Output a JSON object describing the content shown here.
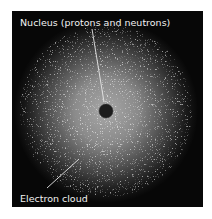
{
  "diagram": {
    "labels": {
      "nucleus": "Nucleus (protons and neutrons)",
      "electron_cloud": "Electron cloud"
    },
    "colors": {
      "background": "#070707",
      "cloud_center": "#9a9a9a",
      "nucleus": "#1c1c1c",
      "label_text": "#f2f2f2"
    }
  }
}
